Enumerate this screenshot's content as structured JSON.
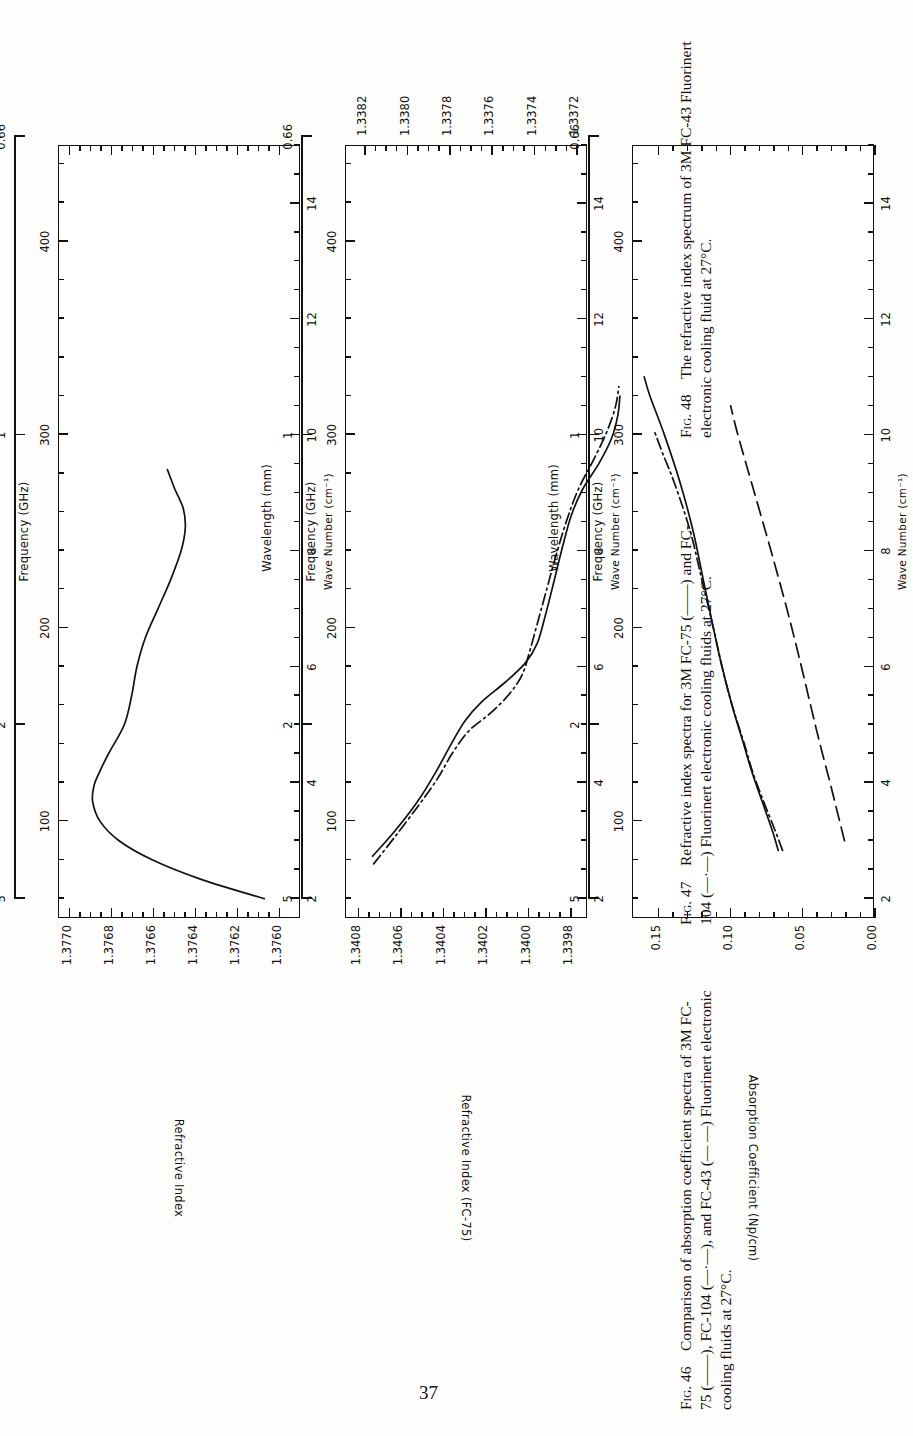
{
  "page": {
    "number": "37"
  },
  "shared_axes": {
    "wavelength_label": "Wavelength  (mm)",
    "wavelength_ticks": [
      "5",
      "2",
      "1",
      "0.66"
    ],
    "frequency_label": "Frequency  (GHz)",
    "frequency_ticks": [
      "100",
      "200",
      "300",
      "400"
    ],
    "wavenumber_label": "Wave Number  (cm⁻¹)",
    "wavenumber_ticks": [
      "2",
      "4",
      "6",
      "8",
      "10",
      "12",
      "14"
    ],
    "frequency_range_ghz": [
      50,
      450
    ],
    "wavenumber_range_cm": [
      1.667,
      15.0
    ]
  },
  "figures": [
    {
      "id": "fig48",
      "number": "48",
      "caption_label": "Fig. 48",
      "caption_text": "The refractive index spectrum of 3M FC-43 Fluorinert electronic cooling fluid at 27°C.",
      "chart_data": {
        "type": "line",
        "title": "The refractive index spectrum of 3M FC-43 Fluorinert electronic cooling fluid at 27°C.",
        "xlabel": "Frequency  (GHz)",
        "ylabel": "Refractive Index",
        "xlabel_secondary_top": "Wavelength  (mm)",
        "xlabel_secondary_bottom": "Wave Number  (cm⁻¹)",
        "xlim": [
          50,
          450
        ],
        "ylim": [
          1.3759,
          1.37705
        ],
        "yticks": [
          "1.3770",
          "1.3768",
          "1.3766",
          "1.3764",
          "1.3762",
          "1.3760"
        ],
        "ytick_values": [
          1.377,
          1.3768,
          1.3766,
          1.3764,
          1.3762,
          1.376
        ],
        "grid": false,
        "legend": "none",
        "series": [
          {
            "name": "FC-43",
            "style": "solid",
            "x": [
              60,
              70,
              80,
              90,
              100,
              110,
              118,
              125,
              135,
              150,
              165,
              180,
              195,
              210,
              225,
              240,
              252,
              262,
              272,
              282
            ],
            "y": [
              1.37607,
              1.37637,
              1.3766,
              1.37676,
              1.37685,
              1.376885,
              1.37688,
              1.376855,
              1.37681,
              1.376735,
              1.3767,
              1.376675,
              1.376635,
              1.376575,
              1.376515,
              1.376465,
              1.376445,
              1.376455,
              1.376495,
              1.37653
            ]
          }
        ]
      }
    },
    {
      "id": "fig47",
      "number": "47",
      "caption_label": "Fig. 47",
      "caption_text": "Refractive index spectra for 3M FC-75 (——) and FC-104 (—·—) Fluorinert electronic cooling fluids at 27°C.",
      "chart_data": {
        "type": "line",
        "title": "Refractive index spectra for 3M FC-75 and FC-104 Fluorinert electronic cooling fluids at 27°C.",
        "xlabel": "Frequency  (GHz)",
        "ylabel": "Refractive Index (FC-75)",
        "ylabel_secondary": "Refractive Index (FC-104)",
        "xlabel_secondary_top": "Wavelength  (mm)",
        "xlabel_secondary_bottom": "Wave Number  (cm⁻¹)",
        "xlim": [
          50,
          450
        ],
        "ylim_fc75": [
          1.33972,
          1.34086
        ],
        "yticks_fc75": [
          "1.3408",
          "1.3406",
          "1.3404",
          "1.3402",
          "1.3400",
          "1.3398"
        ],
        "ytick_values_fc75": [
          1.3408,
          1.3406,
          1.3404,
          1.3402,
          1.34,
          1.3398
        ],
        "ylim_fc104": [
          1.33715,
          1.33829
        ],
        "yticks_fc104": [
          "1.3382",
          "1.3380",
          "1.3378",
          "1.3376",
          "1.3374",
          "1.3372"
        ],
        "ytick_values_fc104": [
          1.3382,
          1.338,
          1.3378,
          1.3376,
          1.3374,
          1.3372
        ],
        "grid": false,
        "legend": "none",
        "series": [
          {
            "name": "FC-75",
            "style": "solid",
            "x": [
              82,
              95,
              110,
              125,
              140,
              152,
              162,
              172,
              182,
              192,
              205,
              220,
              240,
              258,
              272,
              285,
              298,
              310,
              320
            ],
            "y": [
              1.34073,
              1.340625,
              1.34052,
              1.340435,
              1.34036,
              1.340295,
              1.340215,
              1.340105,
              1.34001,
              1.339955,
              1.33992,
              1.339885,
              1.33984,
              1.339795,
              1.33974,
              1.339665,
              1.339605,
              1.339575,
              1.339565
            ]
          },
          {
            "name": "FC-104",
            "style": "dash-dot",
            "x": [
              78,
              92,
              108,
              122,
              136,
              147,
              156,
              166,
              176,
              188,
              202,
              218,
              238,
              256,
              272,
              288,
              302,
              315,
              325
            ],
            "y": [
              1.338155,
              1.338055,
              1.337945,
              1.337855,
              1.33778,
              1.337705,
              1.337605,
              1.337515,
              1.337455,
              1.33742,
              1.337385,
              1.337345,
              1.337295,
              1.337245,
              1.33719,
              1.337115,
              1.337055,
              1.337015,
              1.337
            ]
          }
        ]
      }
    },
    {
      "id": "fig46",
      "number": "46",
      "caption_label": "Fig. 46",
      "caption_text": "Comparison of absorption coefficient spectra of 3M FC-75 (——), FC-104 (—·—), and FC-43 (— —) Fluorinert electronic cooling fluids at 27°C.",
      "chart_data": {
        "type": "line",
        "title": "Comparison of absorption coefficient spectra of 3M FC-75, FC-104, and FC-43 Fluorinert electronic cooling fluids at 27°C.",
        "xlabel": "Frequency  (GHz)",
        "ylabel": "Absorption Coefficient  (Np/cm)",
        "xlabel_secondary_top": "Wavelength  (mm)",
        "xlabel_secondary_bottom": "Wave Number  (cm⁻¹)",
        "xlim": [
          50,
          450
        ],
        "ylim": [
          0.0,
          0.168
        ],
        "yticks": [
          "0.15",
          "0.10",
          "0.05",
          "0.00"
        ],
        "ytick_values": [
          0.15,
          0.1,
          0.05,
          0.0
        ],
        "grid": false,
        "legend": "none",
        "series": [
          {
            "name": "FC-75",
            "style": "solid",
            "x": [
              85,
              95,
              110,
              125,
              140,
              160,
              180,
              200,
              225,
              250,
              275,
              300,
              320,
              330
            ],
            "y": [
              0.0665,
              0.0705,
              0.0775,
              0.0845,
              0.0905,
              0.0985,
              0.1055,
              0.1115,
              0.1185,
              0.1255,
              0.1345,
              0.1455,
              0.1555,
              0.1595
            ]
          },
          {
            "name": "FC-104",
            "style": "dash-dot",
            "x": [
              85,
              95,
              110,
              125,
              140,
              160,
              180,
              200,
              225,
              250,
              275,
              290,
              302
            ],
            "y": [
              0.0635,
              0.0685,
              0.0765,
              0.084,
              0.09,
              0.0985,
              0.1055,
              0.1115,
              0.1195,
              0.1275,
              0.1385,
              0.1465,
              0.1525
            ]
          },
          {
            "name": "FC-43",
            "style": "long-dash",
            "x": [
              90,
              105,
              120,
              140,
              160,
              185,
              210,
              240,
              270,
              300,
              315
            ],
            "y": [
              0.0205,
              0.0255,
              0.0305,
              0.0375,
              0.044,
              0.052,
              0.0605,
              0.0715,
              0.083,
              0.0945,
              0.0995
            ]
          }
        ]
      }
    }
  ]
}
